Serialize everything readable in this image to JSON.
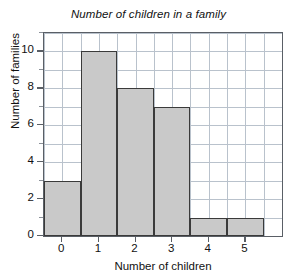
{
  "chart_data": {
    "type": "bar",
    "title": "Number of children in a family",
    "xlabel": "Number of children",
    "ylabel": "Number of families",
    "categories": [
      "0",
      "1",
      "2",
      "3",
      "4",
      "5"
    ],
    "values": [
      3,
      10,
      8,
      7,
      1,
      1
    ],
    "series": [
      {
        "name": "Number of families",
        "values": [
          3,
          10,
          8,
          7,
          1,
          1
        ]
      }
    ],
    "xlim": [
      -0.5,
      6.0
    ],
    "ylim": [
      0,
      11
    ],
    "xticks": [
      "0",
      "1",
      "2",
      "3",
      "4",
      "5"
    ],
    "yticks": [
      "0",
      "2",
      "4",
      "6",
      "8",
      "10"
    ],
    "y_minor_tick_interval": 1,
    "grid": true,
    "legend": false,
    "bar_fill_color": "#c9c9c9",
    "bar_edge_color": "#3a3a3a",
    "grid_color": "#b9c2cc",
    "axis_color": "#5a5f66",
    "text_color": "#111111",
    "background_color": "#ffffff",
    "title_style": "italic",
    "bar_width_units": 1,
    "bar_alignment": "centered-on-tick"
  }
}
